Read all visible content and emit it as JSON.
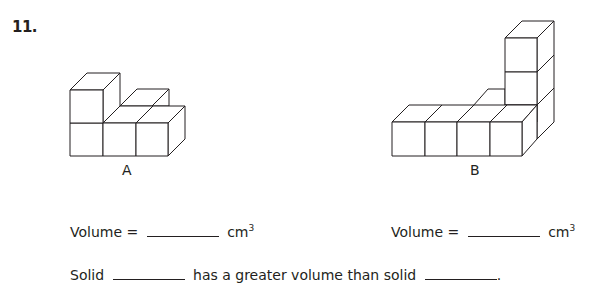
{
  "question": {
    "number": "11."
  },
  "solids": [
    {
      "id": "A",
      "label": "A",
      "cube_count_visible": 5
    },
    {
      "id": "B",
      "label": "B",
      "cube_count_visible": 8
    }
  ],
  "volume_lines": [
    {
      "prefix": "Volume =",
      "unit": "cm",
      "exponent": "3",
      "answer": ""
    },
    {
      "prefix": "Volume =",
      "unit": "cm",
      "exponent": "3",
      "answer": ""
    }
  ],
  "comparison": {
    "part1": "Solid",
    "part2": "has a greater volume than solid",
    "part3": ".",
    "blank1": "",
    "blank2": ""
  },
  "colors": {
    "ink": "#231f20",
    "background": "#ffffff"
  }
}
